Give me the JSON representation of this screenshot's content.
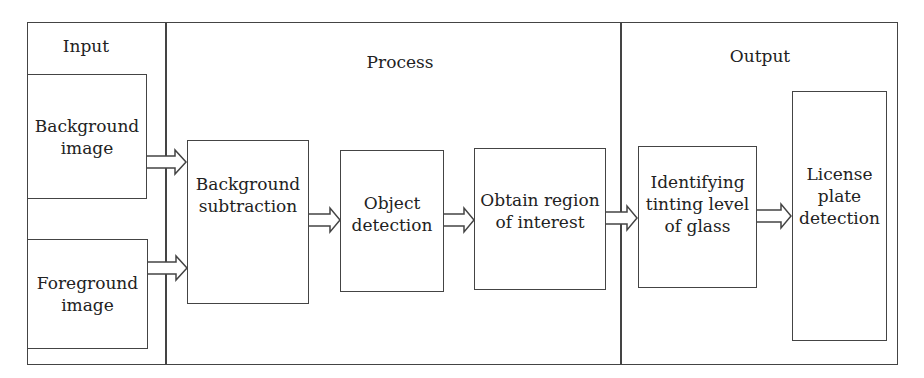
{
  "sections": {
    "input": "Input",
    "process": "Process",
    "output": "Output"
  },
  "nodes": {
    "background_image": "Background\nimage",
    "foreground_image": "Foreground\nimage",
    "background_subtraction": "Background\nsubtraction",
    "object_detection": "Object\ndetection",
    "obtain_roi": "Obtain region\nof interest",
    "identifying_tint": "Identifying\ntinting level\nof glass",
    "license_plate": "License\nplate\ndetection"
  },
  "edges": [
    {
      "from": "background_image",
      "to": "background_subtraction"
    },
    {
      "from": "foreground_image",
      "to": "background_subtraction"
    },
    {
      "from": "background_subtraction",
      "to": "object_detection"
    },
    {
      "from": "object_detection",
      "to": "obtain_roi"
    },
    {
      "from": "obtain_roi",
      "to": "identifying_tint"
    },
    {
      "from": "identifying_tint",
      "to": "license_plate"
    }
  ]
}
